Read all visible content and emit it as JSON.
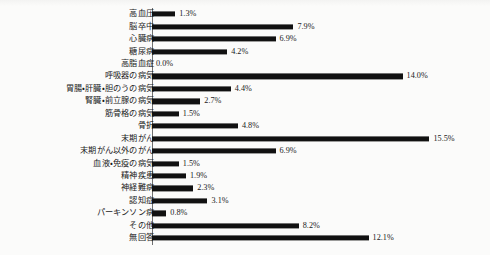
{
  "chart_data": {
    "type": "bar",
    "orientation": "horizontal",
    "title": "",
    "xlabel": "",
    "ylabel": "",
    "xlim": [
      0,
      16
    ],
    "grid": false,
    "legend": false,
    "value_suffix": "%",
    "bar_color": "#111111",
    "background_color": "#fbfbfa",
    "axis_color": "#6f6f6f",
    "text_color": "#1a1a1a",
    "categories": [
      "高血圧",
      "脳卒中",
      "心臓病",
      "糖尿病",
      "高脂血症",
      "呼吸器の病気",
      "胃腸・肝臓・胆のうの病気",
      "腎臓・前立腺の病気",
      "筋骨格の病気",
      "骨折",
      "末期がん",
      "末期がん以外のがん",
      "血液・免疫の病気",
      "精神疾患",
      "神経難病",
      "認知症",
      "パーキンソン病",
      "その他",
      "無回答"
    ],
    "values": [
      1.3,
      7.9,
      6.9,
      4.2,
      0.0,
      14.0,
      4.4,
      2.7,
      1.5,
      4.8,
      15.5,
      6.9,
      1.5,
      1.9,
      2.3,
      3.1,
      0.8,
      8.2,
      12.1
    ],
    "value_labels": [
      "1.3%",
      "7.9%",
      "6.9%",
      "4.2%",
      "0.0%",
      "14.0%",
      "4.4%",
      "2.7%",
      "1.5%",
      "4.8%",
      "15.5%",
      "6.9%",
      "1.5%",
      "1.9%",
      "2.3%",
      "3.1%",
      "0.8%",
      "8.2%",
      "12.1%"
    ]
  }
}
